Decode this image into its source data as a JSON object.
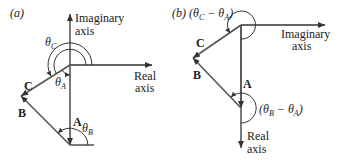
{
  "panel_a": {
    "tag": "(a)",
    "imag_axis_line1": "Imaginary",
    "imag_axis_line2": "axis",
    "real_axis_line1": "Real",
    "real_axis_line2": "axis",
    "vector_a": "A",
    "vector_b": "B",
    "vector_c": "C",
    "theta_c": "θ",
    "theta_c_sub": "C",
    "theta_a": "θ",
    "theta_a_sub": "A",
    "theta_b": "θ",
    "theta_b_sub": "B"
  },
  "panel_b": {
    "tag": "(b)",
    "angle_ca": "(θ",
    "angle_ca_sub1": "C",
    "angle_ca_mid": " − θ",
    "angle_ca_sub2": "A",
    "angle_ca_end": ")",
    "angle_ba": "(θ",
    "angle_ba_sub1": "B",
    "angle_ba_mid": " − θ",
    "angle_ba_sub2": "A",
    "angle_ba_end": ")",
    "imag_axis_line1": "Imaginary",
    "imag_axis_line2": "axis",
    "real_axis_line1": "Real",
    "real_axis_line2": "axis",
    "vector_a": "A",
    "vector_b": "B",
    "vector_c": "C"
  },
  "colors": {
    "axis": "#333333",
    "vector": "#555555",
    "background": "#ffffff"
  }
}
